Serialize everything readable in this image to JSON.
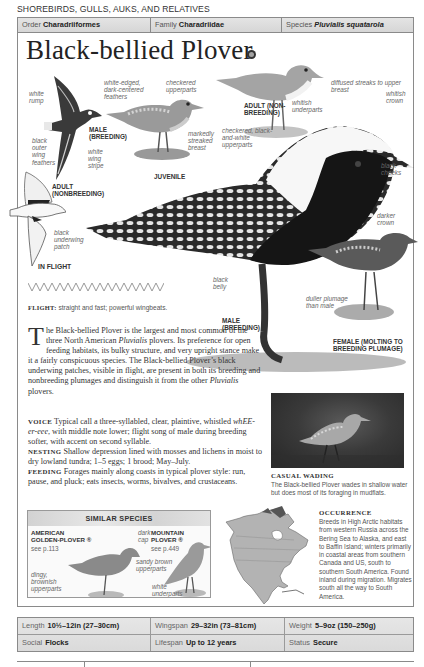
{
  "section_title": "SHOREBIRDS, GULLS, AUKS, AND RELATIVES",
  "taxonomy": {
    "order": {
      "label": "Order",
      "value": "Charadriiformes"
    },
    "family": {
      "label": "Family",
      "value": "Charadriidae"
    },
    "species": {
      "label": "Species",
      "value": "Pluvialis squatarola"
    }
  },
  "title": "Black-bellied Plover",
  "audio_icon": "audio-icon",
  "illustrations": {
    "flight_male": {
      "caption": "MALE (BREEDING)",
      "labels": {
        "white_rump": "white rump",
        "black_outer_wing": "black outer wing feathers",
        "white_wing_stripe": "white wing stripe"
      }
    },
    "flight_adult_nonbreeding": {
      "caption": "ADULT (NONBREEDING)",
      "labels": {
        "black_underwing": "black underwing patch"
      }
    },
    "in_flight_caption": "IN FLIGHT",
    "juvenile": {
      "caption": "JUVENILE",
      "labels": {
        "white_edged": "white-edged, dark-centered feathers",
        "checkered_upperparts": "checkered upperparts",
        "streaked_breast": "markedly streaked breast"
      }
    },
    "adult_nonbreeding": {
      "caption": "ADULT (NON-BREEDING)",
      "labels": {
        "diffused_streaks": "diffused streaks to upper breast",
        "whitish_underparts": "whitish underparts"
      }
    },
    "male_breeding": {
      "caption": "MALE (BREEDING)",
      "labels": {
        "whitish_crown": "whitish crown",
        "black_cheeks": "black cheeks",
        "checkered_bw": "checkered, black-and-white upperparts",
        "black_belly": "black belly"
      }
    },
    "female": {
      "caption": "FEMALE (MOLTING TO BREEDING PLUMAGE)",
      "labels": {
        "darker_crown": "darker crown",
        "duller_plumage": "duller plumage than male"
      }
    }
  },
  "flight": {
    "label": "FLIGHT:",
    "text": "straight and fast; powerful wingbeats."
  },
  "intro": {
    "drop_cap": "T",
    "text_1": "he Black-bellied Plover is the largest and most common of the three North American ",
    "italic_1": "Pluvialis",
    "text_2": " plovers. Its preference for open feeding habitats, its bulky structure, and very upright stance make it a fairly conspicuous species. The Black-bellied Plover’s black underwing patches, visible in flight, are present in both its breeding and nonbreeding plumages and distinguish it from the other ",
    "italic_2": "Pluvialis",
    "text_3": " plovers."
  },
  "voice": {
    "label": "VOICE",
    "text_1": "Typical call a three-syllabled, clear, plaintive, whistled ",
    "italic": "whEE-er-eee",
    "text_2": ", with middle note lower; flight song of male during breeding softer, with accent on second syllable."
  },
  "nesting": {
    "label": "NESTING",
    "text": "Shallow depression lined with mosses and lichens in moist to dry lowland tundra; 1–5 eggs; 1 brood; May–July."
  },
  "feeding": {
    "label": "FEEDING",
    "text": "Forages mainly along coasts in typical plover style: run, pause, and pluck; eats insects, worms, bivalves, and crustaceans."
  },
  "photo": {
    "title": "CASUAL WADING",
    "caption": "The Black-bellied Plover wades in shallow water but does most of its foraging in mudflats."
  },
  "similar_species": {
    "heading": "SIMILAR SPECIES",
    "items": [
      {
        "name": "AMERICAN GOLDEN-PLOVER ®",
        "ref": "see p.113",
        "labels": [
          "dark cap",
          "dingy, brownish upperparts"
        ]
      },
      {
        "name": "MOUNTAIN PLOVER ®",
        "ref": "see p.449",
        "labels": [
          "sandy brown upperparts",
          "white underparts"
        ]
      }
    ]
  },
  "occurrence": {
    "title": "OCCURRENCE",
    "text": "Breeds in High Arctic habitats from western Russia across the Bering Sea to Alaska, and east to Baffin Island; winters primarily in coastal areas from southern Canada and US, south to southern South America. Found inland during migration. Migrates south all the way to South America."
  },
  "stats": [
    [
      {
        "label": "Length",
        "value": "10½–12in (27–30cm)"
      },
      {
        "label": "Wingspan",
        "value": "29–32in (73–81cm)"
      },
      {
        "label": "Weight",
        "value": "5–9oz (150–250g)"
      }
    ],
    [
      {
        "label": "Social",
        "value": "Flocks"
      },
      {
        "label": "Lifespan",
        "value": "Up to 12 years"
      },
      {
        "label": "Status",
        "value": "Secure"
      }
    ]
  ]
}
